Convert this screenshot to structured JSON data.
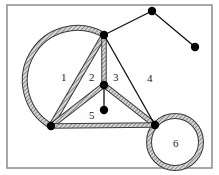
{
  "diagram": {
    "frame": {
      "x": 7,
      "y": 5,
      "width": 205,
      "height": 163,
      "stroke": "#8a8a8a",
      "fill": "#ffffff"
    },
    "colors": {
      "vertex": "#000000",
      "thin_edge": "#111111",
      "hatched_edge_outer": "#3a3a3a",
      "hatched_edge_inner": "#bdbdbd"
    },
    "vertices": [
      {
        "id": "A",
        "x": 104,
        "y": 35
      },
      {
        "id": "B",
        "x": 152,
        "y": 11
      },
      {
        "id": "C",
        "x": 195,
        "y": 47
      },
      {
        "id": "D",
        "x": 104,
        "y": 85
      },
      {
        "id": "E",
        "x": 104,
        "y": 110
      },
      {
        "id": "F",
        "x": 51,
        "y": 126
      },
      {
        "id": "G",
        "x": 155,
        "y": 125
      }
    ],
    "thin_edges": [
      {
        "from": "A",
        "to": "B"
      },
      {
        "from": "B",
        "to": "C"
      },
      {
        "from": "A",
        "to": "G"
      },
      {
        "from": "D",
        "to": "E"
      }
    ],
    "hatched_edges": [
      {
        "from": "A",
        "to": "F"
      },
      {
        "from": "A",
        "to": "D"
      },
      {
        "from": "D",
        "to": "F"
      },
      {
        "from": "D",
        "to": "G"
      },
      {
        "from": "F",
        "to": "G"
      }
    ],
    "hatched_arcs": [
      {
        "name": "large-arc",
        "from": "A",
        "to": "F",
        "cx": 62,
        "cy": 77,
        "r": 47
      },
      {
        "name": "loop",
        "cx": 175,
        "cy": 142,
        "r": 26,
        "attached_to": "G"
      }
    ],
    "face_labels": [
      {
        "text": "1",
        "x": 61,
        "y": 81
      },
      {
        "text": "2",
        "x": 89,
        "y": 81
      },
      {
        "text": "3",
        "x": 113,
        "y": 81
      },
      {
        "text": "4",
        "x": 147,
        "y": 82
      },
      {
        "text": "5",
        "x": 89,
        "y": 119
      },
      {
        "text": "6",
        "x": 173,
        "y": 147
      }
    ]
  }
}
